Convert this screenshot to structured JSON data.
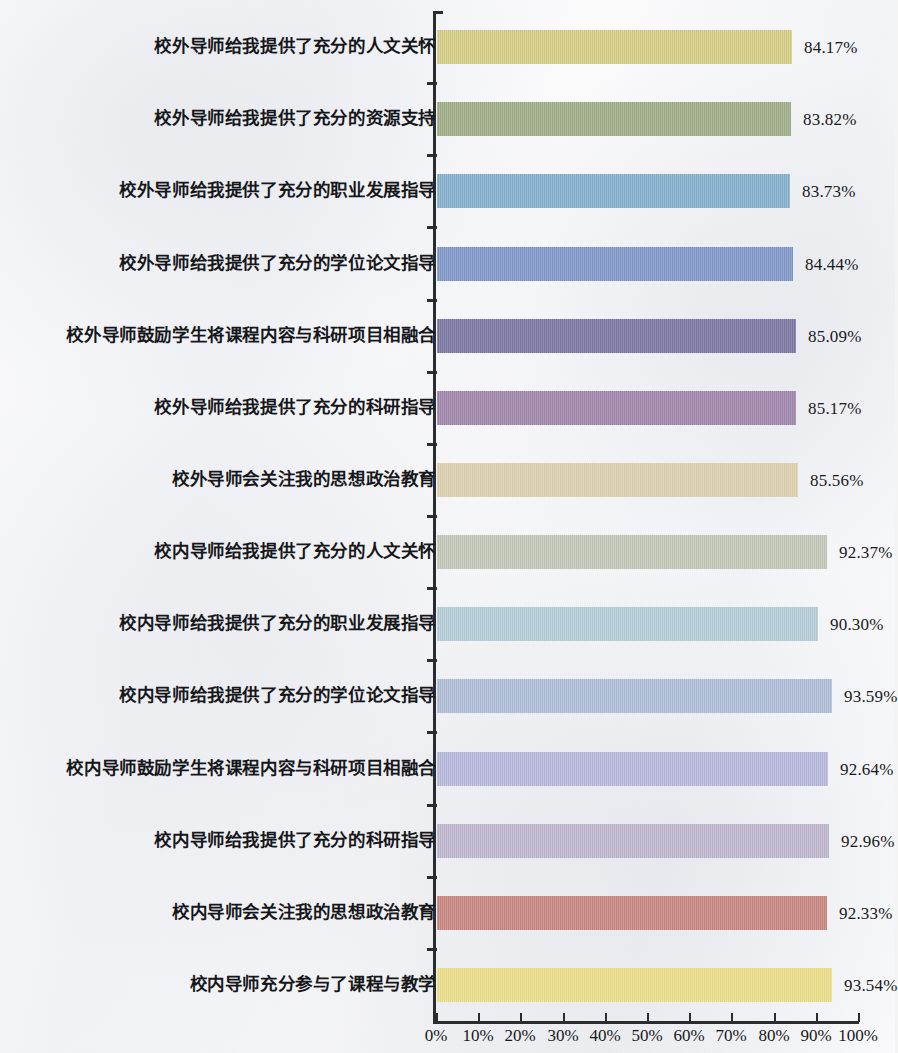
{
  "chart_data": {
    "type": "bar",
    "orientation": "horizontal",
    "title": "",
    "subtitle": "",
    "xlabel": "",
    "ylabel": "",
    "xlim": [
      0,
      100
    ],
    "grid": false,
    "legend": "none",
    "axis_tick_labels": [
      "0%",
      "10%",
      "20%",
      "30%",
      "40%",
      "50%",
      "60%",
      "70%",
      "80%",
      "90%",
      "100%"
    ],
    "axis_tick_values": [
      0,
      10,
      20,
      30,
      40,
      50,
      60,
      70,
      80,
      90,
      100
    ],
    "categories": [
      "校外导师给我提供了充分的人文关怀",
      "校外导师给我提供了充分的资源支持",
      "校外导师给我提供了充分的职业发展指导",
      "校外导师给我提供了充分的学位论文指导",
      "校外导师鼓励学生将课程内容与科研项目相融合",
      "校外导师给我提供了充分的科研指导",
      "校外导师会关注我的思想政治教育",
      "校内导师给我提供了充分的人文关怀",
      "校内导师给我提供了充分的职业发展指导",
      "校内导师给我提供了充分的学位论文指导",
      "校内导师鼓励学生将课程内容与科研项目相融合",
      "校内导师给我提供了充分的科研指导",
      "校内导师会关注我的思想政治教育",
      "校内导师充分参与了课程与教学"
    ],
    "values": [
      84.17,
      83.82,
      83.73,
      84.44,
      85.09,
      85.17,
      85.56,
      92.37,
      90.3,
      93.59,
      92.64,
      92.96,
      92.33,
      93.54
    ],
    "value_labels": [
      "84.17%",
      "83.82%",
      "83.73%",
      "84.44%",
      "85.09%",
      "85.17%",
      "85.56%",
      "92.37%",
      "90.30%",
      "93.59%",
      "92.64%",
      "92.96%",
      "92.33%",
      "93.54%"
    ],
    "bar_colors": [
      "#d5cd85",
      "#a0ad87",
      "#86b0ce",
      "#8098c9",
      "#7b77a3",
      "#a086ab",
      "#dcd1b0",
      "#c4c8b8",
      "#b4cdd8",
      "#aebdd7",
      "#b7b9dd",
      "#bfb6cd",
      "#c98780",
      "#ecde8a"
    ]
  }
}
